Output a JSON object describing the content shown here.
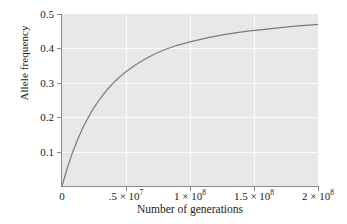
{
  "chart_data": {
    "type": "line",
    "title": "",
    "xlabel": "Number of generations",
    "ylabel": "Allele frequency",
    "xlim": [
      0,
      200000000
    ],
    "ylim": [
      0,
      0.5
    ],
    "grid": true,
    "legend": null,
    "xticks": [
      {
        "value": 0,
        "label": "0",
        "mantissa": "0",
        "exponent": ""
      },
      {
        "value": 50000000,
        "label": ".5 × 10⁷",
        "mantissa": ".5 × 10",
        "exponent": "7"
      },
      {
        "value": 100000000,
        "label": "1 × 10⁸",
        "mantissa": "1 × 10",
        "exponent": "8"
      },
      {
        "value": 150000000,
        "label": "1.5 × 10⁸",
        "mantissa": "1.5 × 10",
        "exponent": "8"
      },
      {
        "value": 200000000,
        "label": "2 × 10⁸",
        "mantissa": "2 × 10",
        "exponent": "8"
      }
    ],
    "yticks": [
      {
        "value": 0.1,
        "label": "0.1"
      },
      {
        "value": 0.2,
        "label": "0.2"
      },
      {
        "value": 0.3,
        "label": "0.3"
      },
      {
        "value": 0.4,
        "label": "0.4"
      },
      {
        "value": 0.5,
        "label": "0.5"
      }
    ],
    "series": [
      {
        "name": "allele-frequency-curve",
        "color": "#7a7a7a",
        "x": [
          0,
          4000000,
          8000000,
          12000000,
          16000000,
          20000000,
          25000000,
          30000000,
          35000000,
          40000000,
          45000000,
          50000000,
          57000000,
          64000000,
          72000000,
          80000000,
          90000000,
          100000000,
          115000000,
          130000000,
          145000000,
          160000000,
          180000000,
          200000000
        ],
        "y": [
          0,
          0.051,
          0.095,
          0.133,
          0.167,
          0.196,
          0.228,
          0.255,
          0.279,
          0.299,
          0.317,
          0.332,
          0.351,
          0.367,
          0.383,
          0.396,
          0.409,
          0.419,
          0.432,
          0.442,
          0.45,
          0.456,
          0.464,
          0.47
        ]
      }
    ],
    "colors": {
      "panel_background": "#e8e8e8",
      "gridline": "#fbfbfb",
      "axis": "#8a8a8a",
      "curve": "#7a7a7a",
      "text": "#222222",
      "figure_background": "#ffffff"
    }
  }
}
